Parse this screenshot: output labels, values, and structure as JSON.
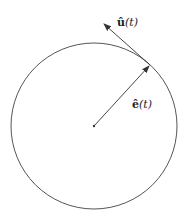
{
  "diagram": {
    "type": "circular-motion-unit-vectors",
    "circle": {
      "cx": 94,
      "cy": 126,
      "r": 83,
      "stroke": "#444444"
    },
    "center": {
      "x": 94,
      "y": 126
    },
    "point_on_circle": {
      "x": 150,
      "y": 65
    },
    "vectors": [
      {
        "id": "u",
        "symbol": "û",
        "arg": "(t)",
        "label": "û(t)",
        "from": [
          150,
          65
        ],
        "to": [
          103,
          23
        ],
        "kind": "tangent"
      },
      {
        "id": "e",
        "symbol": "ê",
        "arg": "(t)",
        "label": "ê(t)",
        "from": [
          94,
          126
        ],
        "to": [
          150,
          65
        ],
        "kind": "radial"
      }
    ],
    "labels": {
      "u_symbol": "û",
      "u_arg": "(t)",
      "e_symbol": "ê",
      "e_arg": "(t)"
    }
  }
}
